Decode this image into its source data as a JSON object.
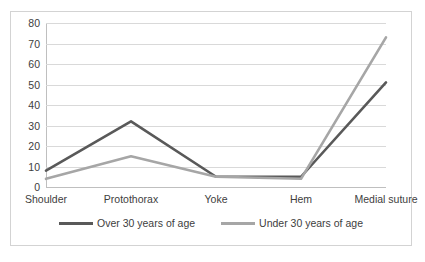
{
  "chart_data": {
    "type": "line",
    "title": "",
    "xlabel": "",
    "ylabel": "",
    "categories": [
      "Shoulder",
      "Protothorax",
      "Yoke",
      "Hem",
      "Medial suture"
    ],
    "series": [
      {
        "name": "Over 30 years of age",
        "values": [
          8,
          32,
          5,
          5,
          51
        ],
        "color": "#595959"
      },
      {
        "name": "Under 30 years of age",
        "values": [
          4,
          15,
          5,
          4,
          73
        ],
        "color": "#a6a6a6"
      }
    ],
    "ylim": [
      0,
      80
    ],
    "ytick_labels": [
      "0",
      "10",
      "20",
      "30",
      "40",
      "50",
      "60",
      "70",
      "80"
    ],
    "ytick_values": [
      0,
      10,
      20,
      30,
      40,
      50,
      60,
      70,
      80
    ],
    "grid": true,
    "legend_position": "bottom"
  },
  "legend": {
    "items": [
      {
        "label": "Over 30 years of age",
        "color": "#595959"
      },
      {
        "label": "Under 30 years of age",
        "color": "#a6a6a6"
      }
    ]
  },
  "colors": {
    "series_over_30": "#595959",
    "series_under_30": "#a6a6a6",
    "gridline": "#d9d9d9",
    "axis": "#bfbfbf",
    "frame": "#d3d3d3",
    "background": "#ffffff",
    "text": "#404040"
  }
}
